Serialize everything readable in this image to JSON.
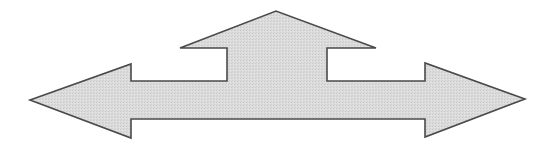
{
  "diagram": {
    "shape": "three-way-arrow",
    "directions": [
      "left",
      "up",
      "right"
    ],
    "fill_color": "#dcdcdc",
    "texture_color": "#c8c8c8",
    "stroke_color": "#4a4a4a",
    "background_color": "#ffffff"
  }
}
